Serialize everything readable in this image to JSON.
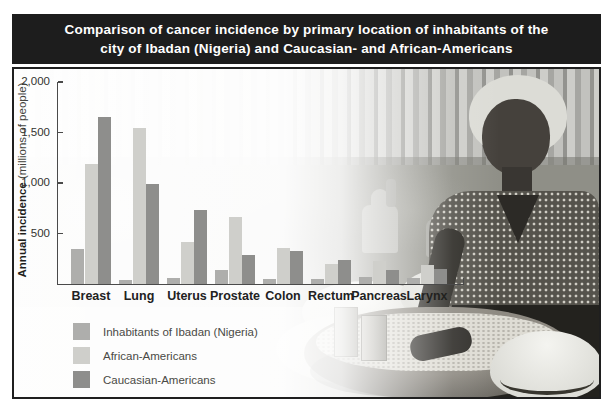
{
  "title": {
    "line1": "Comparison of cancer incidence by primary location of inhabitants of the",
    "line2": "city of Ibadan (Nigeria) and Caucasian- and African-Americans"
  },
  "chart_data": {
    "type": "bar",
    "title": "Comparison of cancer incidence by primary location of inhabitants of the city of Ibadan (Nigeria) and Caucasian- and African-Americans",
    "categories": [
      "Breast",
      "Lung",
      "Uterus",
      "Prostate",
      "Colon",
      "Rectum",
      "Pancreas",
      "Larynx"
    ],
    "series": [
      {
        "name": "Inhabitants of Ibadan (Nigeria)",
        "color": "#aeaeac",
        "values": [
          350,
          35,
          55,
          135,
          45,
          45,
          70,
          55
        ]
      },
      {
        "name": "African-Americans",
        "color": "#cfcfcb",
        "values": [
          1185,
          1540,
          415,
          665,
          360,
          200,
          225,
          190
        ]
      },
      {
        "name": "Caucasian-Americans",
        "color": "#8e8e8c",
        "values": [
          1655,
          990,
          730,
          285,
          325,
          240,
          135,
          150
        ]
      }
    ],
    "ylabel_bold": "Annual incidence",
    "ylabel_normal": "(millions of people)",
    "xlabel": "",
    "ylim": [
      0,
      2000
    ],
    "yticks": [
      {
        "value": 500,
        "label": "500"
      },
      {
        "value": 1000,
        "label": "1,000"
      },
      {
        "value": 1500,
        "label": "1,500"
      },
      {
        "value": 2000,
        "label": "2,000"
      }
    ],
    "grid": false,
    "legend_position": "bottom-left"
  },
  "colors": {
    "title_bar_bg": "#1d1d1d",
    "title_text": "#ffffff",
    "frame_border": "#1f1f1f",
    "axis": "#4a4a4a"
  }
}
